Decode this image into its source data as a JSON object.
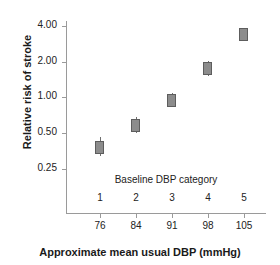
{
  "chart_data": {
    "type": "scatter",
    "title": "",
    "xlabel": "Approximate mean usual DBP (mmHg)",
    "ylabel": "Relative risk of stroke",
    "y_scale": "log",
    "ylim": [
      0.2,
      4.6
    ],
    "yticks": [
      4.0,
      2.0,
      1.0,
      0.5,
      0.25
    ],
    "ytick_labels": [
      "4.00",
      "2.00",
      "1.00",
      "0.50",
      "0.25"
    ],
    "grid": false,
    "legend": "none",
    "secondary_axis_title": "Baseline DBP category",
    "categories": [
      "1",
      "2",
      "3",
      "4",
      "5"
    ],
    "x": [
      76,
      84,
      91,
      98,
      105
    ],
    "xtick_labels": [
      "76",
      "84",
      "91",
      "98",
      "105"
    ],
    "values": [
      0.38,
      0.58,
      0.95,
      1.75,
      3.4
    ],
    "errors_low": [
      0.32,
      0.5,
      0.83,
      1.52,
      3.05
    ],
    "errors_high": [
      0.46,
      0.69,
      1.1,
      2.05,
      3.85
    ],
    "marker": "filled-square",
    "marker_color": "#8c8c8c",
    "marker_edge_color": "#5d5d5d",
    "error_bar_color": "#6f6f6f",
    "axis_color": "#9a9a9a"
  }
}
